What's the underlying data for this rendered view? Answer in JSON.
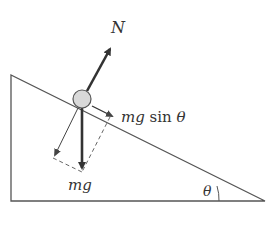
{
  "diagram": {
    "type": "free-body diagram on inclined plane",
    "labels": {
      "normal_force": "N",
      "parallel_component_prefix": "mg",
      "parallel_component_func": "sin",
      "parallel_component_angle": "θ",
      "weight": "mg",
      "incline_angle": "θ"
    },
    "colors": {
      "line": "#444444",
      "arrow_heavy": "#333333",
      "ball_fill": "#d9d9d9",
      "ball_stroke": "#555555",
      "background": "#ffffff"
    }
  }
}
